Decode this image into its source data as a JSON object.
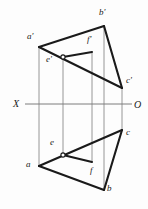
{
  "figure": {
    "type": "descriptive-geometry-projection",
    "canvas": {
      "width": 148,
      "height": 209
    },
    "colors": {
      "background": "#fdfdfd",
      "heavy_stroke": "#1a1a1a",
      "thin_stroke": "#8a8a8a",
      "axis_stroke": "#7c7c7c",
      "label_color": "#1a1a1a",
      "node_fill": "#ffffff"
    },
    "axis": {
      "name": "ground-line",
      "y": 104,
      "x_start": 25,
      "x_end": 132,
      "left_label": "X",
      "right_label": "O",
      "left_label_x": 13,
      "left_label_y": 99,
      "right_label_x": 134,
      "right_label_y": 100
    },
    "points": [
      {
        "id": "a_prime",
        "label": "a'",
        "x": 39,
        "y": 47,
        "lx": 27,
        "ly": 32,
        "view": "front",
        "marker": "none"
      },
      {
        "id": "b_prime",
        "label": "b'",
        "x": 104,
        "y": 26,
        "lx": 99,
        "ly": 8,
        "view": "front",
        "marker": "none"
      },
      {
        "id": "c_prime",
        "label": "c'",
        "x": 122,
        "y": 88,
        "lx": 126,
        "ly": 76,
        "view": "front",
        "marker": "none"
      },
      {
        "id": "e_prime",
        "label": "e'",
        "x": 63,
        "y": 57,
        "lx": 46,
        "ly": 55,
        "view": "front",
        "marker": "circle"
      },
      {
        "id": "f_prime",
        "label": "f'",
        "x": 92,
        "y": 52,
        "lx": 87,
        "ly": 35,
        "view": "front",
        "marker": "none"
      },
      {
        "id": "a",
        "label": "a",
        "x": 39,
        "y": 166,
        "lx": 26,
        "ly": 160,
        "view": "top",
        "marker": "none"
      },
      {
        "id": "b",
        "label": "b",
        "x": 104,
        "y": 190,
        "lx": 107,
        "ly": 184,
        "view": "top",
        "marker": "none"
      },
      {
        "id": "c",
        "label": "c",
        "x": 122,
        "y": 130,
        "lx": 126,
        "ly": 128,
        "view": "top",
        "marker": "none"
      },
      {
        "id": "e",
        "label": "e",
        "x": 63,
        "y": 155,
        "lx": 50,
        "ly": 138,
        "view": "top",
        "marker": "circle"
      },
      {
        "id": "f",
        "label": "f",
        "x": 92,
        "y": 162,
        "lx": 90,
        "ly": 166,
        "view": "top",
        "marker": "none"
      }
    ],
    "heavy_edges": [
      {
        "name": "edge-a-prime-b-prime",
        "from": "a_prime",
        "to": "b_prime"
      },
      {
        "name": "edge-b-prime-c-prime",
        "from": "b_prime",
        "to": "c_prime"
      },
      {
        "name": "edge-a-prime-c-prime",
        "from": "a_prime",
        "to": "c_prime"
      },
      {
        "name": "edge-e-prime-f-prime",
        "from": "e_prime",
        "to": "f_prime"
      },
      {
        "name": "edge-a-b",
        "from": "a",
        "to": "b"
      },
      {
        "name": "edge-b-c",
        "from": "b",
        "to": "c"
      },
      {
        "name": "edge-a-c",
        "from": "a",
        "to": "c"
      },
      {
        "name": "edge-e-f",
        "from": "e",
        "to": "f"
      }
    ],
    "projection_lines": [
      {
        "name": "projector-a",
        "x": 39,
        "y1": 47,
        "y2": 166
      },
      {
        "name": "projector-e",
        "x": 63,
        "y1": 57,
        "y2": 155
      },
      {
        "name": "projector-f",
        "x": 92,
        "y1": 52,
        "y2": 162
      },
      {
        "name": "projector-b",
        "x": 104,
        "y1": 26,
        "y2": 190
      },
      {
        "name": "projector-c",
        "x": 122,
        "y1": 88,
        "y2": 130
      }
    ]
  }
}
